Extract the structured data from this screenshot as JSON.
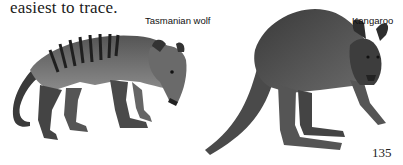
{
  "page": {
    "body_text": "easiest to trace.",
    "page_number": "135"
  },
  "illustrations": [
    {
      "label": "Tasmanian wolf",
      "subject": "thylacine-illustration"
    },
    {
      "label": "Kangaroo",
      "subject": "kangaroo-illustration"
    }
  ],
  "colors": {
    "ink": "#1a1a1a",
    "paper": "#ffffff"
  }
}
